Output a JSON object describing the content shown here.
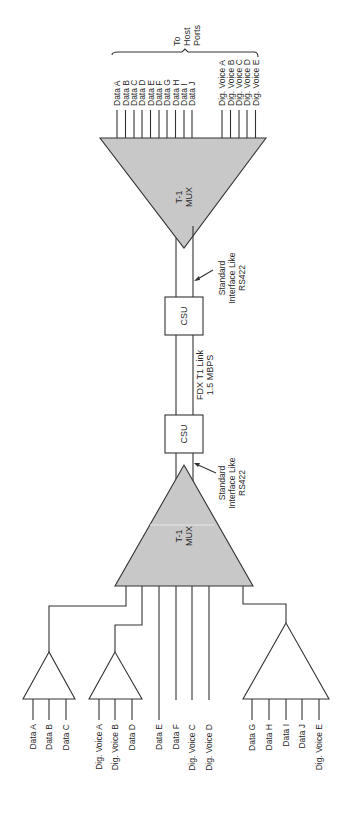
{
  "diagram": {
    "type": "T-1 multiplexer network diagram (rotated 90° counter-clockwise)",
    "colors": {
      "mux_fill": "#c8c8c8",
      "stroke": "#333333",
      "background": "#ffffff"
    },
    "host_side": {
      "bracket_label_lines": [
        "To",
        "Host",
        "Ports"
      ],
      "data_labels": [
        "Data A",
        "Data B",
        "Data C",
        "Data D",
        "Data E",
        "Data F",
        "Data G",
        "Data H",
        "Data I",
        "Data J"
      ],
      "voice_labels": [
        "Dig. Voice A",
        "Dig. Voice B",
        "Dig. Voice C",
        "Dig. Voice D",
        "Dig. Voice E"
      ]
    },
    "top_mux": {
      "label_lines": [
        "T-1",
        "MUX"
      ]
    },
    "top_interface": {
      "label_lines": [
        "Standard",
        "Interface Like",
        "RS422"
      ]
    },
    "top_csu": {
      "label": "CSU"
    },
    "link": {
      "label_lines": [
        "FDX T1 Link",
        "1.5 MBPS"
      ]
    },
    "bottom_csu": {
      "label": "CSU"
    },
    "bottom_interface": {
      "label_lines": [
        "Standard",
        "Interface Like",
        "RS422"
      ]
    },
    "bottom_mux": {
      "label_lines": [
        "T-1",
        "MUX"
      ]
    },
    "remote_side": {
      "sub_mux_1": {
        "inputs": [
          "Data A",
          "Data B",
          "Data C"
        ]
      },
      "sub_mux_2": {
        "inputs": [
          "Dig. Voice A",
          "Dig. Voice B",
          "Data D"
        ]
      },
      "direct_inputs": [
        "Data E",
        "Data F",
        "Dig. Voice C",
        "Dig. Voice D"
      ],
      "sub_mux_3": {
        "inputs": [
          "Data G",
          "Data H",
          "Data I",
          "Data J",
          "Dig. Voice E"
        ]
      }
    }
  }
}
